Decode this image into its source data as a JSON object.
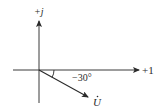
{
  "diagram": {
    "type": "phasor-diagram",
    "axes": {
      "real_label": "+1",
      "imag_label": "+j"
    },
    "phasor": {
      "label": "U",
      "label_accent": "dot",
      "angle_label": "−30°",
      "angle_deg": -30
    },
    "colors": {
      "line": "#3a3a3a",
      "background": "#ffffff"
    }
  }
}
